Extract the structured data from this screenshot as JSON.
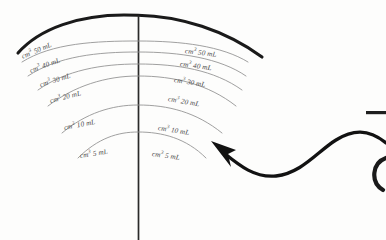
{
  "figure": {
    "background_color": "#fdfdfc",
    "ink_color": "#1a1a1a",
    "graduation_color": "#8a8a8a",
    "label_color": "#4a4a4a"
  },
  "beaker": {
    "rim_label": "beaker-rim-arc",
    "center_line_label": "beaker-center-line"
  },
  "graduations": {
    "unit_left": "cm",
    "left_labels": [
      {
        "text": "cm3 50 mL",
        "unit": "cm",
        "exponent": "3",
        "volume": "50 mL",
        "x": 22,
        "y": 53,
        "rot": -23
      },
      {
        "text": "cm3 40 mL",
        "unit": "cm",
        "exponent": "3",
        "volume": "40 mL",
        "x": 30,
        "y": 67,
        "rot": -20
      },
      {
        "text": "cm3 30 mL",
        "unit": "cm",
        "exponent": "3",
        "volume": "30 mL",
        "x": 40,
        "y": 81,
        "rot": -17
      },
      {
        "text": "cm3 20 mL",
        "unit": "cm",
        "exponent": "3",
        "volume": "20 mL",
        "x": 50,
        "y": 97,
        "rot": -14
      },
      {
        "text": "cm3 10 mL",
        "unit": "cm",
        "exponent": "3",
        "volume": "10 mL",
        "x": 64,
        "y": 124,
        "rot": -11
      },
      {
        "text": "cm3 5 mL",
        "unit": "cm",
        "exponent": "3",
        "volume": "5 mL",
        "x": 80,
        "y": 152,
        "rot": -9
      }
    ],
    "right_labels": [
      {
        "text": "cm3 50 mL",
        "unit": "cm",
        "exponent": "3",
        "volume": "50 mL",
        "x": 185,
        "y": 47,
        "rot": 7
      },
      {
        "text": "cm3 40 mL",
        "unit": "cm",
        "exponent": "3",
        "volume": "40 mL",
        "x": 180,
        "y": 60,
        "rot": 8
      },
      {
        "text": "cm3 30 mL",
        "unit": "cm",
        "exponent": "3",
        "volume": "30 mL",
        "x": 174,
        "y": 76,
        "rot": 9
      },
      {
        "text": "cm3 20 mL",
        "unit": "cm",
        "exponent": "3",
        "volume": "20 mL",
        "x": 168,
        "y": 95,
        "rot": 10
      },
      {
        "text": "cm3 10 mL",
        "unit": "cm",
        "exponent": "3",
        "volume": "10 mL",
        "x": 158,
        "y": 124,
        "rot": 9
      },
      {
        "text": "cm3 5 mL",
        "unit": "cm",
        "exponent": "3",
        "volume": "5 mL",
        "x": 152,
        "y": 150,
        "rot": 8
      }
    ]
  },
  "annotation": {
    "arrow_name": "curved-pointer-arrow",
    "points_to": "beaker graduation scale"
  },
  "edge_marks": {
    "dash": "—",
    "paren": "("
  }
}
